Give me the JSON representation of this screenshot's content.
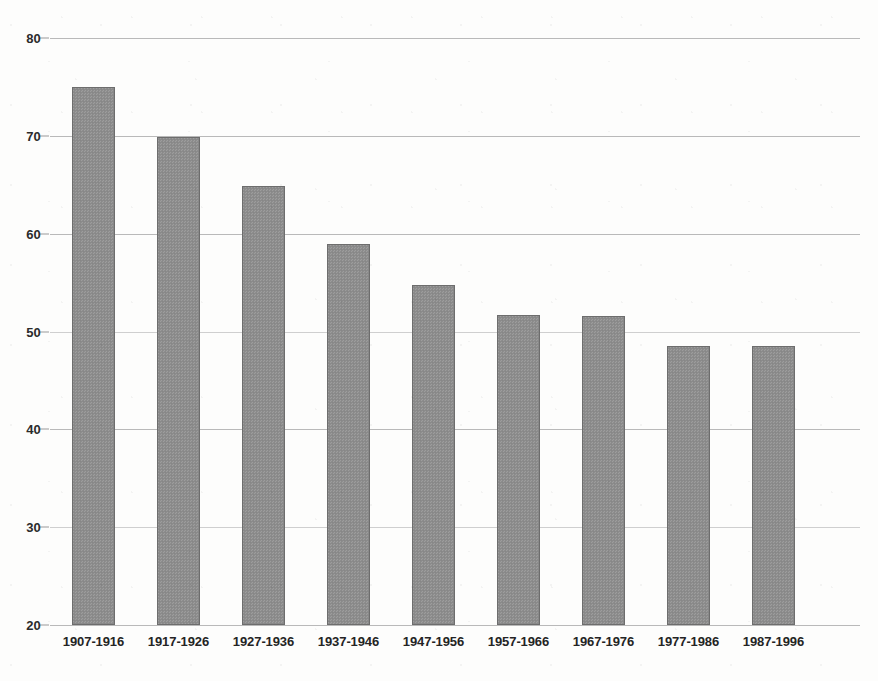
{
  "chart_data": {
    "type": "bar",
    "title": "",
    "xlabel": "",
    "ylabel": "",
    "categories": [
      "1907-1916",
      "1917-1926",
      "1927-1936",
      "1937-1946",
      "1947-1956",
      "1957-1966",
      "1967-1976",
      "1977-1986",
      "1987-1996"
    ],
    "values": [
      75.0,
      69.9,
      64.9,
      58.9,
      54.8,
      51.7,
      51.6,
      48.5,
      48.5
    ],
    "ylim": [
      20,
      80
    ],
    "ytick_labels": [
      "80",
      "70",
      "60",
      "50",
      "40",
      "30",
      "20"
    ],
    "ytick_values": [
      80,
      70,
      60,
      50,
      40,
      30,
      20
    ],
    "grid": "horizontal",
    "legend": "none",
    "series": [
      {
        "name": "",
        "values": [
          75.0,
          69.9,
          64.9,
          58.9,
          54.8,
          51.7,
          51.6,
          48.5,
          48.5
        ]
      }
    ],
    "bar_fill_color": "#8e8e8e",
    "bar_border_color": "#6d6d6d",
    "gridline_color": "#b9b9b9",
    "background_color": "#fdfdfc",
    "text_color": "#242424"
  }
}
